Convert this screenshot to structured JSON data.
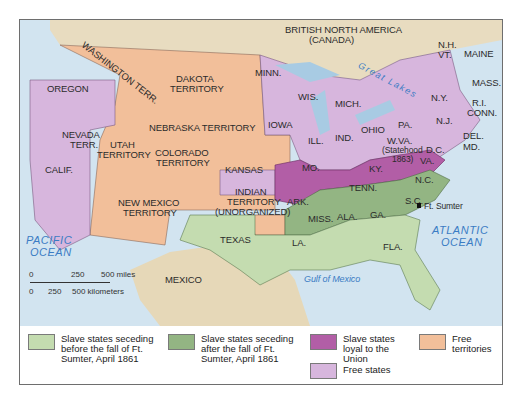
{
  "map": {
    "regions": {
      "british_north_america": "BRITISH NORTH AMERICA",
      "canada": "(CANADA)",
      "great_lakes": "Great Lakes",
      "washington": "WASHINGTON TERR.",
      "oregon": "OREGON",
      "dakota": "DAKOTA",
      "dakota2": "TERRITORY",
      "nebraska": "NEBRASKA TERRITORY",
      "nevada": "NEVADA",
      "nevada2": "TERR.",
      "utah": "UTAH",
      "utah2": "TERRITORY",
      "colorado": "COLORADO",
      "colorado2": "TERRITORY",
      "calif": "CALIF.",
      "kansas": "KANSAS",
      "new_mexico": "NEW MEXICO",
      "new_mexico2": "TERRITORY",
      "indian": "INDIAN",
      "indian2": "TERRITORY",
      "indian3": "(UNORGANIZED)",
      "texas": "TEXAS",
      "mexico": "MEXICO",
      "minn": "MINN.",
      "wis": "WIS.",
      "mich": "MICH.",
      "iowa": "IOWA",
      "ill": "ILL.",
      "ind": "IND.",
      "ohio": "OHIO",
      "mo": "MO.",
      "ky": "KY.",
      "wva": "W.VA.",
      "wva2": "(Statehood",
      "wva3": "1863)",
      "dc": "D.C.",
      "va": "VA.",
      "nc": "N.C.",
      "tenn": "TENN.",
      "ark": "ARK.",
      "sc": "S.C.",
      "ga": "GA.",
      "ala": "ALA.",
      "miss": "MISS.",
      "la": "LA.",
      "fla": "FLA.",
      "pa": "PA.",
      "ny": "N.Y.",
      "nj": "N.J.",
      "del": "DEL.",
      "md": "MD.",
      "mass": "MASS.",
      "ri": "R.I.",
      "conn": "CONN.",
      "nh": "N.H.",
      "vt": "VT.",
      "maine": "MAINE",
      "ft_sumter": "Ft. Sumter"
    },
    "water": {
      "pacific": "PACIFIC",
      "pacific2": "OCEAN",
      "atlantic": "ATLANTIC",
      "atlantic2": "OCEAN",
      "gulf": "Gulf of Mexico"
    },
    "scale": {
      "miles_0": "0",
      "miles_250": "250",
      "miles_500": "500 miles",
      "km_0": "0",
      "km_250": "250",
      "km_500": "500 kilometers"
    }
  },
  "legend": {
    "items": [
      {
        "label": "Slave states seceding before the fall of Ft. Sumter, April 1861",
        "color": "#c4dcb0"
      },
      {
        "label": "Slave states seceding after the fall of Ft. Sumter, April 1861",
        "color": "#93b583"
      },
      {
        "label": "Slave states loyal to the Union",
        "color": "#b25ea6"
      },
      {
        "label": "Free territories",
        "color": "#f2bf9a"
      },
      {
        "label": "Free states",
        "color": "#d7b6dd"
      }
    ]
  }
}
